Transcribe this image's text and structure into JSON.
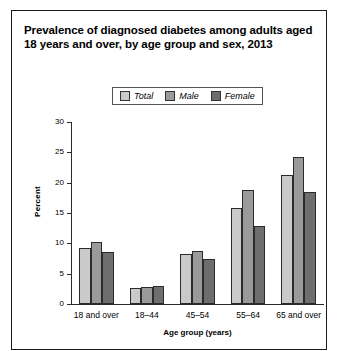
{
  "figure": {
    "title": "Prevalence of diagnosed diabetes among adults aged 18 years and over, by age group and sex, 2013"
  },
  "legend": {
    "position": "top-center",
    "entries": [
      {
        "label": "Total",
        "color": "#cacaca"
      },
      {
        "label": "Male",
        "color": "#9a9a9a"
      },
      {
        "label": "Female",
        "color": "#6e6e6e"
      }
    ]
  },
  "chart_data": {
    "type": "bar",
    "title": "Prevalence of diagnosed diabetes among adults aged 18 years and over, by age group and sex, 2013",
    "xlabel": "Age group (years)",
    "ylabel": "Percent",
    "categories": [
      "18 and over",
      "18–44",
      "45–54",
      "55–64",
      "65 and over"
    ],
    "series": [
      {
        "name": "Total",
        "color": "#cacaca",
        "values": [
          9.3,
          2.7,
          8.2,
          15.8,
          21.2
        ]
      },
      {
        "name": "Male",
        "color": "#9a9a9a",
        "values": [
          10.2,
          2.8,
          8.8,
          18.8,
          24.3
        ]
      },
      {
        "name": "Female",
        "color": "#6e6e6e",
        "values": [
          8.5,
          2.9,
          7.4,
          12.8,
          18.5
        ]
      }
    ],
    "ylim": [
      0,
      30
    ],
    "yticks": [
      0,
      5,
      10,
      15,
      20,
      25,
      30
    ],
    "ytick_labels": [
      "0",
      "5",
      "10",
      "15",
      "20",
      "25",
      "30"
    ],
    "grid": false,
    "legend_position": "top-center"
  }
}
